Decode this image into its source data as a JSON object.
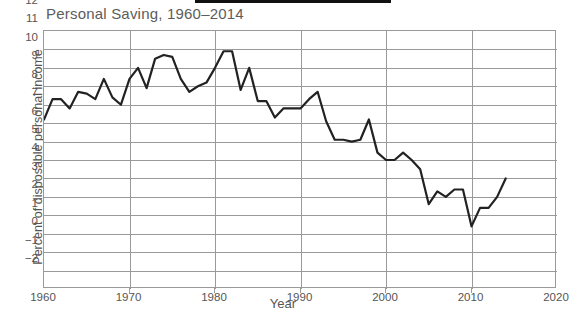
{
  "chart_data": {
    "type": "line",
    "title": "Personal Saving, 1960–2014",
    "xlabel": "Year",
    "ylabel": "Percent of disposable personal income",
    "xlim": [
      1960,
      2020
    ],
    "ylim": [
      -2,
      12
    ],
    "grid": true,
    "legend": "none",
    "x_ticks": [
      1960,
      1970,
      1980,
      1990,
      2000,
      2010,
      2020
    ],
    "y_ticks": [
      -2,
      -1,
      0,
      1,
      2,
      3,
      4,
      5,
      6,
      7,
      8,
      9,
      10,
      11,
      12
    ],
    "series": [
      {
        "name": "Personal saving rate",
        "color": "#222222",
        "x": [
          1960,
          1961,
          1962,
          1963,
          1964,
          1965,
          1966,
          1967,
          1968,
          1969,
          1970,
          1971,
          1972,
          1973,
          1974,
          1975,
          1976,
          1977,
          1978,
          1979,
          1980,
          1981,
          1982,
          1983,
          1984,
          1985,
          1986,
          1987,
          1988,
          1989,
          1990,
          1991,
          1992,
          1993,
          1994,
          1995,
          1996,
          1997,
          1998,
          1999,
          2000,
          2001,
          2002,
          2003,
          2004,
          2005,
          2006,
          2007,
          2008,
          2009,
          2010,
          2011,
          2012,
          2013,
          2014
        ],
        "values": [
          7.2,
          8.3,
          8.3,
          7.8,
          8.7,
          8.6,
          8.3,
          9.4,
          8.4,
          8.0,
          9.4,
          10.0,
          8.9,
          10.5,
          10.7,
          10.6,
          9.4,
          8.7,
          9.0,
          9.2,
          10.0,
          10.9,
          10.9,
          8.8,
          10.0,
          8.2,
          8.2,
          7.3,
          7.8,
          7.8,
          7.8,
          8.3,
          8.7,
          7.1,
          6.1,
          6.1,
          6.0,
          6.1,
          7.2,
          5.4,
          5.0,
          5.0,
          5.4,
          5.0,
          4.5,
          2.6,
          3.3,
          3.0,
          3.4,
          3.4,
          1.4,
          2.4,
          2.4,
          3.0,
          4.0
        ]
      }
    ]
  }
}
